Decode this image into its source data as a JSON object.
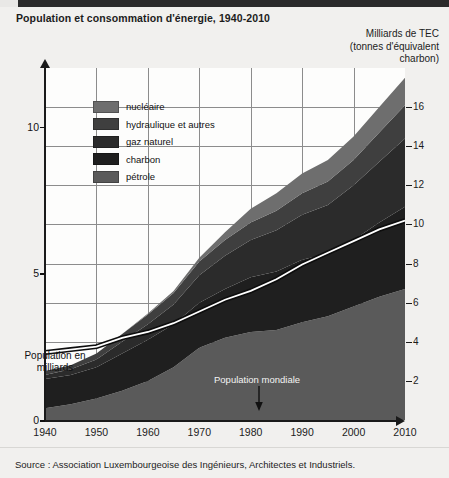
{
  "header": {
    "title": "Population et consommation d'énergie, 1940-2010",
    "right_axis_title_line1": "Milliards de TEC",
    "right_axis_title_line2": "(tonnes d'équivalent",
    "right_axis_title_line3": "charbon)"
  },
  "left_axis": {
    "title_line1": "Population en",
    "title_line2": "milliards",
    "ticks": [
      "0",
      "5",
      "10"
    ]
  },
  "right_axis": {
    "ticks": [
      "2",
      "4",
      "6",
      "8",
      "10",
      "12",
      "14",
      "16"
    ]
  },
  "x_axis": {
    "ticks": [
      "1940",
      "1950",
      "1960",
      "1970",
      "1980",
      "1990",
      "2000",
      "2010"
    ]
  },
  "legend": {
    "items": [
      {
        "label": "nucléaire",
        "color": "#6e6e6e"
      },
      {
        "label": "hydraulique et autres",
        "color": "#3f3f3f"
      },
      {
        "label": "gaz naturel",
        "color": "#2b2b2b"
      },
      {
        "label": "charbon",
        "color": "#1f1f1f"
      },
      {
        "label": "pétrole",
        "color": "#5a5a5a"
      }
    ]
  },
  "annotation": {
    "population_line_label": "Population mondiale"
  },
  "footer": {
    "source": "Source :  Association Luxembourgeoise des Ingénieurs, Architectes et Industriels."
  },
  "chart_data": {
    "type": "area",
    "title": "Population et consommation d'énergie, 1940-2010",
    "subtitle": "",
    "xlabel": "",
    "ylabel": "Milliards de TEC (tonnes d'équivalent charbon)",
    "ylabel_secondary": "Population en milliards",
    "xlim": [
      1940,
      2010
    ],
    "ylim": [
      0,
      18
    ],
    "ylim_secondary": [
      0,
      12
    ],
    "grid": true,
    "legend_position": "upper-left-inside",
    "stacked": true,
    "x": [
      1940,
      1945,
      1950,
      1955,
      1960,
      1965,
      1970,
      1975,
      1980,
      1985,
      1990,
      1995,
      2000,
      2005,
      2010
    ],
    "series": [
      {
        "name": "pétrole",
        "color": "#5a5a5a",
        "values": [
          0.6,
          0.8,
          1.1,
          1.5,
          2.0,
          2.7,
          3.7,
          4.2,
          4.5,
          4.6,
          5.0,
          5.3,
          5.8,
          6.3,
          6.7
        ]
      },
      {
        "name": "charbon",
        "color": "#1f1f1f",
        "values": [
          1.5,
          1.5,
          1.6,
          1.9,
          2.1,
          2.2,
          2.3,
          2.5,
          2.8,
          3.0,
          3.2,
          3.2,
          3.4,
          3.8,
          4.2
        ]
      },
      {
        "name": "gaz naturel",
        "color": "#2b2b2b",
        "values": [
          0.2,
          0.3,
          0.4,
          0.6,
          0.8,
          1.0,
          1.4,
          1.7,
          1.9,
          2.1,
          2.3,
          2.5,
          2.8,
          3.1,
          3.5
        ]
      },
      {
        "name": "hydraulique et autres",
        "color": "#3f3f3f",
        "values": [
          0.2,
          0.2,
          0.3,
          0.4,
          0.5,
          0.6,
          0.7,
          0.8,
          0.9,
          1.0,
          1.1,
          1.2,
          1.3,
          1.5,
          1.7
        ]
      },
      {
        "name": "nucléaire",
        "color": "#6e6e6e",
        "values": [
          0.0,
          0.0,
          0.0,
          0.0,
          0.05,
          0.1,
          0.2,
          0.4,
          0.7,
          0.9,
          1.0,
          1.1,
          1.2,
          1.3,
          1.4
        ]
      }
    ],
    "overlay_line": {
      "name": "Population mondiale",
      "color": "#ffffff",
      "axis": "secondary",
      "values": [
        2.3,
        2.4,
        2.5,
        2.8,
        3.0,
        3.3,
        3.7,
        4.1,
        4.4,
        4.8,
        5.3,
        5.7,
        6.1,
        6.5,
        6.8
      ]
    }
  }
}
